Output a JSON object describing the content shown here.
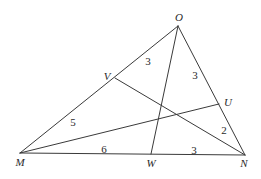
{
  "diagram": {
    "type": "triangle-with-cevians",
    "points": {
      "O": {
        "label": "O",
        "x": 178,
        "y": 26,
        "lx": 179,
        "ly": 21
      },
      "M": {
        "label": "M",
        "x": 20,
        "y": 153,
        "lx": 20,
        "ly": 166
      },
      "N": {
        "label": "N",
        "x": 245,
        "y": 155,
        "lx": 244,
        "ly": 167
      },
      "W": {
        "label": "W",
        "x": 151,
        "y": 154,
        "lx": 151,
        "ly": 167
      },
      "V": {
        "label": "V",
        "x": 115,
        "y": 78,
        "lx": 107,
        "ly": 80
      },
      "U": {
        "label": "U",
        "x": 219,
        "y": 104,
        "lx": 228,
        "ly": 106
      }
    },
    "segments": [
      {
        "name": "segment-OM",
        "from": "O",
        "to": "M"
      },
      {
        "name": "segment-ON",
        "from": "O",
        "to": "N"
      },
      {
        "name": "segment-MN",
        "from": "M",
        "to": "N"
      },
      {
        "name": "segment-OW",
        "from": "O",
        "to": "W"
      },
      {
        "name": "segment-VN",
        "from": "V",
        "to": "N"
      },
      {
        "name": "segment-MU",
        "from": "M",
        "to": "U"
      }
    ],
    "lengths": [
      {
        "name": "length-OV",
        "segment": "OV",
        "value": "3",
        "x": 145,
        "y": 65
      },
      {
        "name": "length-OU",
        "segment": "OU",
        "value": "3",
        "x": 193,
        "y": 79
      },
      {
        "name": "length-VM",
        "segment": "VM",
        "value": "5",
        "x": 70,
        "y": 126
      },
      {
        "name": "length-UN",
        "segment": "UN",
        "value": "2",
        "x": 221,
        "y": 134
      },
      {
        "name": "length-MW",
        "segment": "MW",
        "value": "6",
        "x": 101,
        "y": 153
      },
      {
        "name": "length-WN",
        "segment": "WN",
        "value": "3",
        "x": 191,
        "y": 154
      }
    ]
  }
}
